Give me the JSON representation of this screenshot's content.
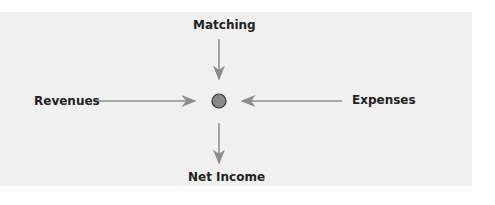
{
  "diagram": {
    "center_node": {
      "shape": "circle",
      "color": "#8a8a8a"
    },
    "labels": {
      "top": "Matching",
      "left": "Revenues",
      "right": "Expenses",
      "bottom": "Net Income"
    },
    "edges": [
      {
        "from": "Matching",
        "to": "center"
      },
      {
        "from": "Revenues",
        "to": "center"
      },
      {
        "from": "Expenses",
        "to": "center"
      },
      {
        "from": "center",
        "to": "Net Income"
      }
    ],
    "colors": {
      "background": "#f1f1f1",
      "arrow": "#8c8c8c",
      "text": "#222222"
    }
  }
}
